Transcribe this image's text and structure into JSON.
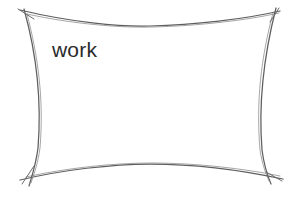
{
  "canvas": {
    "width": 300,
    "height": 198,
    "background_color": "#ffffff",
    "title": "work"
  },
  "drawing": {
    "type": "freehand-sketch",
    "shape_name": "rectangle-concave-sides",
    "stroke_color": "#5f5f5f",
    "stroke_color_secondary": "#7a7a7a",
    "stroke_width": 1.2,
    "fill": "none",
    "corners": {
      "top_left": [
        27,
        14
      ],
      "top_right": [
        272,
        14
      ],
      "bottom_left": [
        27,
        176
      ],
      "bottom_right": [
        272,
        176
      ]
    },
    "overshoot": "lines extend past each corner junction",
    "edges": [
      {
        "name": "top-edge",
        "from": [
          27,
          14
        ],
        "to": [
          272,
          14
        ],
        "bow": "sags downward toward center",
        "mid": [
          150,
          26
        ]
      },
      {
        "name": "right-edge",
        "from": [
          272,
          14
        ],
        "to": [
          272,
          176
        ],
        "bow": "bows inward toward center",
        "mid": [
          258,
          95
        ]
      },
      {
        "name": "bottom-edge",
        "from": [
          272,
          176
        ],
        "to": [
          27,
          176
        ],
        "bow": "rises upward toward center",
        "mid": [
          150,
          164
        ]
      },
      {
        "name": "left-edge",
        "from": [
          27,
          176
        ],
        "to": [
          27,
          14
        ],
        "bow": "bows inward toward center",
        "mid": [
          41,
          95
        ]
      }
    ]
  },
  "annotations": {
    "work_label": {
      "text": "work",
      "color": "#2b2b2b",
      "font_size_px": 21,
      "x": 52,
      "y": 39
    }
  }
}
